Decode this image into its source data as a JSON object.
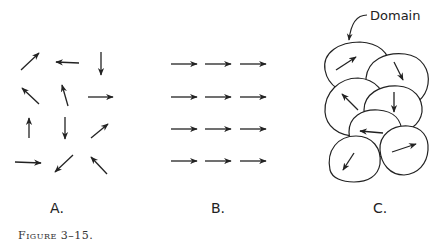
{
  "figure": {
    "caption": "Figure 3–15.",
    "panels": [
      {
        "id": "A",
        "label": "A.",
        "description": "Randomly oriented magnetic moments"
      },
      {
        "id": "B",
        "label": "B.",
        "description": "Aligned magnetic moments"
      },
      {
        "id": "C",
        "label": "C.",
        "description": "Magnetic domains",
        "annotation": "Domain"
      }
    ]
  },
  "panel_a": {
    "arrows": [
      {
        "x1": 21,
        "y1": 70,
        "x2": 39,
        "y2": 53
      },
      {
        "x1": 79,
        "y1": 63,
        "x2": 56,
        "y2": 62
      },
      {
        "x1": 101,
        "y1": 52,
        "x2": 101,
        "y2": 75
      },
      {
        "x1": 39,
        "y1": 104,
        "x2": 22,
        "y2": 88
      },
      {
        "x1": 68,
        "y1": 106,
        "x2": 62,
        "y2": 85
      },
      {
        "x1": 88,
        "y1": 97,
        "x2": 113,
        "y2": 97
      },
      {
        "x1": 29,
        "y1": 138,
        "x2": 29,
        "y2": 118
      },
      {
        "x1": 65,
        "y1": 117,
        "x2": 65,
        "y2": 139
      },
      {
        "x1": 91,
        "y1": 138,
        "x2": 108,
        "y2": 124
      },
      {
        "x1": 15,
        "y1": 162,
        "x2": 41,
        "y2": 163
      },
      {
        "x1": 73,
        "y1": 155,
        "x2": 55,
        "y2": 172
      },
      {
        "x1": 107,
        "y1": 174,
        "x2": 91,
        "y2": 157
      }
    ]
  },
  "panel_b": {
    "rows": [
      64,
      97,
      129,
      161
    ],
    "cols": [
      [
        171,
        197
      ],
      [
        205,
        231
      ],
      [
        240,
        266
      ]
    ]
  },
  "panel_c": {
    "annotation_label": "Domain",
    "domains": [
      {
        "path": "M325,70 C322,52 340,42 360,42 C378,43 390,52 390,68 C390,80 380,92 362,94 C342,95 328,86 325,70 Z",
        "arrow": {
          "x1": 336,
          "y1": 70,
          "x2": 356,
          "y2": 57
        }
      },
      {
        "path": "M366,78 C368,60 385,52 405,54 C422,56 430,70 428,84 C426,98 414,108 398,110 C380,110 366,96 366,78 Z",
        "arrow": {
          "x1": 394,
          "y1": 62,
          "x2": 403,
          "y2": 80
        }
      },
      {
        "path": "M325,112 C324,92 340,78 358,78 C376,79 386,92 386,108 C386,124 374,134 356,136 C338,136 326,126 325,112 Z",
        "arrow": {
          "x1": 358,
          "y1": 110,
          "x2": 342,
          "y2": 94
        }
      },
      {
        "path": "M364,110 C364,94 380,85 398,86 C414,87 423,98 422,112 C420,125 408,133 394,132 C376,131 364,124 364,110 Z",
        "arrow": {
          "x1": 394,
          "y1": 92,
          "x2": 394,
          "y2": 112
        }
      },
      {
        "path": "M349,132 C349,117 362,109 378,110 C394,111 402,120 402,134 C402,148 392,156 376,157 C360,157 349,146 349,132 Z",
        "arrow": {
          "x1": 383,
          "y1": 133,
          "x2": 360,
          "y2": 131
        }
      },
      {
        "path": "M330,170 C326,150 338,136 356,136 C372,136 382,148 380,164 C378,176 368,182 354,182 C342,182 332,178 330,170 Z",
        "arrow": {
          "x1": 354,
          "y1": 153,
          "x2": 343,
          "y2": 170
        }
      },
      {
        "path": "M380,150 C379,135 392,125 408,126 C422,127 429,137 428,150 C427,164 418,174 404,175 C390,175 381,164 380,150 Z",
        "arrow": {
          "x1": 392,
          "y1": 152,
          "x2": 416,
          "y2": 144
        }
      }
    ],
    "leader": {
      "path": "M367,15 C357,15 351,22 349,40"
    }
  },
  "colors": {
    "ink": "#222222",
    "background": "#ffffff"
  }
}
